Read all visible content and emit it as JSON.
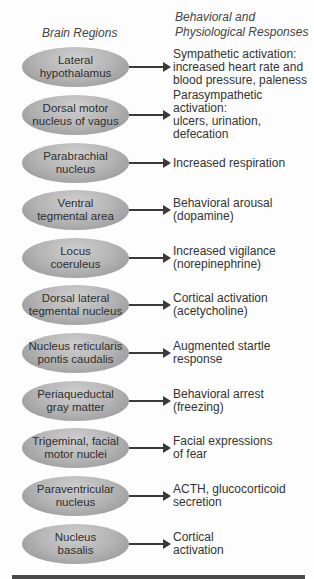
{
  "headers": {
    "left": "Brain Regions",
    "right": "Behavioral and\nPhysiological Responses"
  },
  "rows": [
    {
      "region": "Lateral\nhypothalamus",
      "response": "Sympathetic activation:\nincreased heart rate and\nblood pressure, paleness"
    },
    {
      "region": "Dorsal motor\nnucleus of vagus",
      "response": "Parasympathetic activation:\nulcers, urination, defecation"
    },
    {
      "region": "Parabrachial\nnucleus",
      "response": "Increased respiration"
    },
    {
      "region": "Ventral\ntegmental area",
      "response": "Behavioral arousal\n(dopamine)"
    },
    {
      "region": "Locus\ncoeruleus",
      "response": "Increased vigilance\n(norepinephrine)"
    },
    {
      "region": "Dorsal lateral\ntegmental nucleus",
      "response": "Cortical activation\n(acetycholine)"
    },
    {
      "region": "Nucleus reticularis\npontis caudalis",
      "response": "Augmented startle\nresponse"
    },
    {
      "region": "Periaqueductal\ngray matter",
      "response": "Behavioral arrest\n(freezing)"
    },
    {
      "region": "Trigeminal, facial\nmotor nuclei",
      "response": "Facial expressions\nof fear"
    },
    {
      "region": "Paraventricular\nnucleus",
      "response": "ACTH, glucocorticoid\nsecretion"
    },
    {
      "region": "Nucleus\nbasalis",
      "response": "Cortical\nactivation"
    }
  ]
}
